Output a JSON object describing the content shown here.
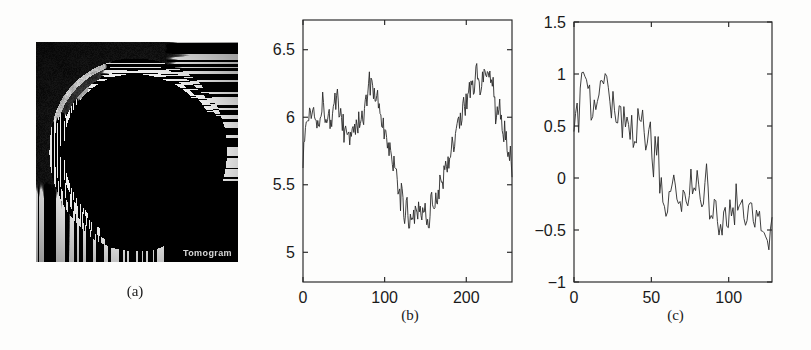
{
  "figure": {
    "background_color": "#fdfdfc",
    "ink_color": "#262626",
    "panels": [
      {
        "id": "a",
        "label": "(a)"
      },
      {
        "id": "b",
        "label": "(b)"
      },
      {
        "id": "c",
        "label": "(c)"
      }
    ]
  },
  "panel_a": {
    "label": "(a)",
    "kind": "mri-image",
    "description": "Axial MRI brain slice at skull-base level",
    "watermark": "Tomogram",
    "background_color": "#0a0a0a",
    "frame": {
      "x": 36,
      "y": 42,
      "width": 202,
      "height": 220
    }
  },
  "chart_data": [
    {
      "panel": "b",
      "label": "(b)",
      "type": "line",
      "title": "",
      "xlabel": "",
      "ylabel": "",
      "xlim": [
        0,
        256
      ],
      "ylim": [
        4.78,
        6.72
      ],
      "xticks": [
        0,
        100,
        200
      ],
      "xticklabels": [
        "0",
        "100",
        "200"
      ],
      "yticks": [
        5,
        5.5,
        6,
        6.5
      ],
      "yticklabels": [
        "5",
        "5.5",
        "6",
        "6.5"
      ],
      "grid": false,
      "legend": null,
      "n_points": 256,
      "line_color": "#2a2a2a",
      "noise_amplitude": 0.155,
      "noise_seed": 1337,
      "envelope_x": [
        0,
        4,
        10,
        18,
        26,
        34,
        42,
        50,
        58,
        66,
        74,
        82,
        88,
        94,
        102,
        110,
        118,
        126,
        134,
        142,
        150,
        158,
        166,
        174,
        182,
        190,
        198,
        206,
        214,
        222,
        230,
        238,
        246,
        252,
        255
      ],
      "envelope_y": [
        5.72,
        5.95,
        6.07,
        6.04,
        6.09,
        6.03,
        6.08,
        5.93,
        5.86,
        5.92,
        6.05,
        6.22,
        6.18,
        6.02,
        5.82,
        5.62,
        5.44,
        5.3,
        5.31,
        5.33,
        5.3,
        5.34,
        5.46,
        5.62,
        5.8,
        5.95,
        6.1,
        6.2,
        6.3,
        6.34,
        6.22,
        6.0,
        5.92,
        5.72,
        5.62
      ],
      "y_min_observed": 5.0,
      "y_max_observed": 6.55
    },
    {
      "panel": "c",
      "label": "(c)",
      "type": "line",
      "title": "",
      "xlabel": "",
      "ylabel": "",
      "xlim": [
        0,
        128
      ],
      "ylim": [
        -1,
        1.5
      ],
      "xticks": [
        0,
        50,
        100
      ],
      "xticklabels": [
        "0",
        "50",
        "100"
      ],
      "yticks": [
        -1,
        -0.5,
        0,
        0.5,
        1,
        1.5
      ],
      "yticklabels": [
        "-1",
        "-0.5",
        "0",
        "0.5",
        "1",
        "1.5"
      ],
      "grid": false,
      "legend": null,
      "n_points": 128,
      "line_color": "#2a2a2a",
      "noise_amplitude": 0.3,
      "noise_seed": 90210,
      "envelope_x": [
        0,
        3,
        6,
        9,
        12,
        16,
        20,
        24,
        28,
        32,
        36,
        40,
        44,
        48,
        52,
        56,
        60,
        64,
        68,
        72,
        76,
        80,
        84,
        88,
        92,
        96,
        100,
        104,
        108,
        112,
        116,
        120,
        124,
        127
      ],
      "envelope_y": [
        0.5,
        0.62,
        0.8,
        0.85,
        0.72,
        0.7,
        0.82,
        0.7,
        0.62,
        0.64,
        0.6,
        0.48,
        0.5,
        0.36,
        0.2,
        0.0,
        -0.18,
        -0.12,
        -0.22,
        -0.04,
        0.02,
        -0.02,
        0.0,
        -0.2,
        -0.32,
        -0.36,
        -0.3,
        -0.26,
        -0.4,
        -0.44,
        -0.4,
        -0.44,
        -0.46,
        -0.52
      ],
      "y_min_observed": -0.85,
      "y_max_observed": 1.22
    }
  ]
}
